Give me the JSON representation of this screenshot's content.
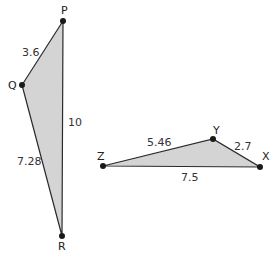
{
  "diagram": {
    "fill_color": "#d4d4d4",
    "stroke_color": "#2a2a2a",
    "vertex_color": "#1a1a1a",
    "triangles": [
      {
        "name": "PQR",
        "vertices": {
          "P": {
            "label": "P",
            "x": 63,
            "y": 21
          },
          "Q": {
            "label": "Q",
            "x": 22,
            "y": 85
          },
          "R": {
            "label": "R",
            "x": 62,
            "y": 236
          }
        },
        "sides": {
          "PQ": "3.6",
          "PR": "10",
          "QR": "7.28"
        }
      },
      {
        "name": "XYZ",
        "vertices": {
          "Z": {
            "label": "Z",
            "x": 103,
            "y": 166
          },
          "Y": {
            "label": "Y",
            "x": 213,
            "y": 139
          },
          "X": {
            "label": "X",
            "x": 260,
            "y": 167
          }
        },
        "sides": {
          "ZY": "5.46",
          "YX": "2.7",
          "ZX": "7.5"
        }
      }
    ]
  }
}
